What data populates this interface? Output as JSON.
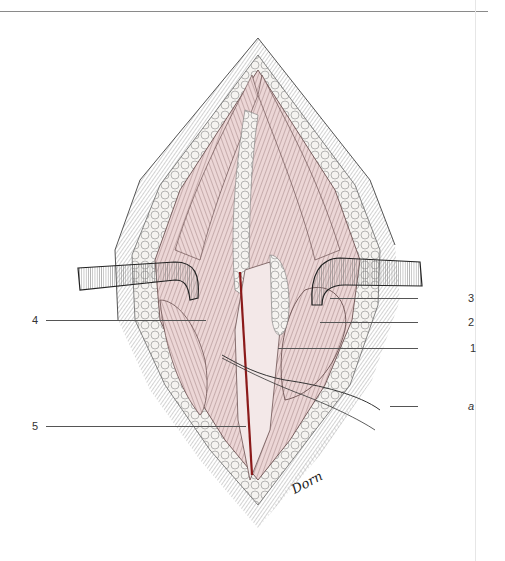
{
  "figure": {
    "type": "surgical-anatomy-illustration",
    "signature": "Dorn",
    "labels": [
      {
        "id": "3",
        "text": "3",
        "side": "right"
      },
      {
        "id": "2",
        "text": "2",
        "side": "right"
      },
      {
        "id": "1",
        "text": "1",
        "side": "right"
      },
      {
        "id": "a",
        "text": "a",
        "side": "right"
      },
      {
        "id": "4",
        "text": "4",
        "side": "left"
      },
      {
        "id": "5",
        "text": "5",
        "side": "left"
      }
    ]
  },
  "colors": {
    "muscle": "#e9d3d3",
    "muscle_stroke": "#6b5050",
    "vessel": "#8b1a1a",
    "fat": "#f4f1ee",
    "retractor": "#bdbdbd",
    "skin_hatch": "#9a9a9a",
    "leader": "#555555"
  }
}
